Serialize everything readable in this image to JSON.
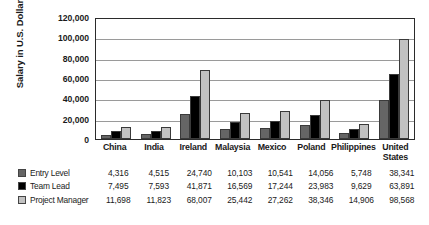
{
  "chart_data": {
    "type": "bar",
    "title": "",
    "xlabel": "",
    "ylabel": "Salary in U.S. Dollars",
    "ylim": [
      0,
      120000
    ],
    "ytick_labels": [
      "120,000",
      "100,000",
      "80,000",
      "60,000",
      "40,000",
      "20,000",
      "0"
    ],
    "ytick_values": [
      120000,
      100000,
      80000,
      60000,
      40000,
      20000,
      0
    ],
    "grid": true,
    "legend_position": "bottom-table",
    "categories": [
      "China",
      "India",
      "Ireland",
      "Malaysia",
      "Mexico",
      "Poland",
      "Philippines",
      "United States"
    ],
    "series": [
      {
        "name": "Entry Level",
        "color": "#656565",
        "values": [
          4316,
          4515,
          24740,
          10103,
          10541,
          14056,
          5748,
          38341
        ],
        "labels": [
          "4,316",
          "4,515",
          "24,740",
          "10,103",
          "10,541",
          "14,056",
          "5,748",
          "38,341"
        ]
      },
      {
        "name": "Team Lead",
        "color": "#000000",
        "values": [
          7495,
          7593,
          41871,
          16569,
          17244,
          23983,
          9629,
          63891
        ],
        "labels": [
          "7,495",
          "7,593",
          "41,871",
          "16,569",
          "17,244",
          "23,983",
          "9,629",
          "63,891"
        ]
      },
      {
        "name": "Project Manager",
        "color": "#c2c2c2",
        "values": [
          11698,
          11823,
          68007,
          25442,
          27262,
          38346,
          14906,
          98568
        ],
        "labels": [
          "11,698",
          "11,823",
          "68,007",
          "25,442",
          "27,262",
          "38,346",
          "14,906",
          "98,568"
        ]
      }
    ]
  },
  "caption": {
    "cropped_text": ""
  }
}
